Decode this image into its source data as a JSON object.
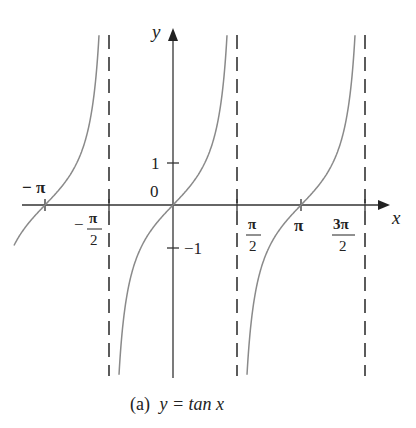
{
  "figure": {
    "caption_prefix": "(a)",
    "caption_formula": "y = tan x",
    "x_axis_label": "x",
    "y_axis_label": "y",
    "origin_label": "0",
    "y_tick_labels": {
      "one": "1",
      "neg_one": "−1"
    },
    "x_tick_labels": {
      "neg_pi": "− π",
      "neg_pi_over_2_num": "π",
      "neg_pi_over_2_den": "2",
      "neg_pi_over_2_sign": "−",
      "pi_over_2_num": "π",
      "pi_over_2_den": "2",
      "pi": "π",
      "three_pi_over_2_num": "3π",
      "three_pi_over_2_den": "2"
    },
    "colors": {
      "curve": "#8a8a8a",
      "axis": "#333333",
      "asymptote": "#333333"
    }
  },
  "chart_data": {
    "type": "line",
    "title": "(a) y = tan x",
    "xlabel": "x",
    "ylabel": "y",
    "function": "tan(x)",
    "x_ticks": [
      "-π",
      "-π/2",
      "π/2",
      "π",
      "3π/2"
    ],
    "y_ticks": [
      1,
      -1
    ],
    "asymptotes": [
      "x = -π/2",
      "x = π/2",
      "x = 3π/2"
    ],
    "xlim": [
      -4.0,
      5.2
    ],
    "ylim": [
      -4,
      4
    ],
    "grid": false,
    "branches": [
      {
        "domain": "(-3π/2, -π/2)",
        "visible_range": "x ≈ -3.6 to -1.65",
        "zero": "-π"
      },
      {
        "domain": "(-π/2, π/2)",
        "zero": "0"
      },
      {
        "domain": "(π/2, 3π/2)",
        "zero": "π"
      }
    ]
  }
}
